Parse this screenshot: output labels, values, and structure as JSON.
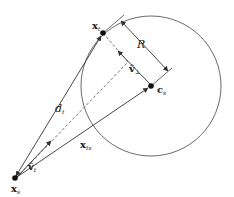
{
  "diagram": {
    "type": "geometry",
    "colors": {
      "stroke": "#333333",
      "background": "#ffffff"
    },
    "circle": {
      "cx": 151,
      "cy": 86,
      "r": 70
    },
    "points": {
      "source": {
        "x": 15,
        "y": 178,
        "label": "x",
        "subscript": "s"
      },
      "tangent": {
        "x": 103,
        "y": 33,
        "label": "x",
        "subscript": "t"
      },
      "center": {
        "x": 151,
        "y": 86,
        "label": "c",
        "subscript": "s"
      }
    },
    "labels": {
      "distance": {
        "text": "d",
        "subscript": "t"
      },
      "radius": {
        "text": "R"
      },
      "v_perp": {
        "text": "v̂",
        "subscript": "⊥"
      },
      "v_t": {
        "text": "v̂",
        "subscript": "t"
      },
      "x_ts": {
        "text": "x",
        "subscript": "ts"
      },
      "x_s": {
        "text": "x",
        "subscript": "s"
      },
      "x_t": {
        "text": "x",
        "subscript": "t"
      },
      "c_s": {
        "text": "c",
        "subscript": "s"
      }
    }
  }
}
